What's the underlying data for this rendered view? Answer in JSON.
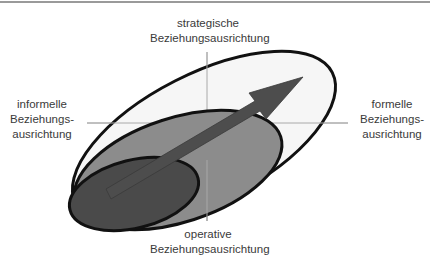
{
  "diagram": {
    "axes": {
      "top": {
        "line1": "strategische",
        "line2": "Beziehungsausrichtung"
      },
      "bottom": {
        "line1": "operative",
        "line2": "Beziehungsausrichtung"
      },
      "left": {
        "line1": "informelle",
        "line2": "Beziehungs-",
        "line3": "ausrichtung"
      },
      "right": {
        "line1": "formelle",
        "line2": "Beziehungs-",
        "line3": "ausrichtung"
      }
    },
    "shapes": {
      "outer_ellipse": {
        "fill": "#f4f4f4",
        "stroke": "#111111"
      },
      "middle_ellipse": {
        "fill": "#8c8c8c",
        "stroke": "#111111"
      },
      "inner_ellipse": {
        "fill": "#4a4a4a",
        "stroke": "#111111"
      },
      "arrow": {
        "fill": "#4d4d4d",
        "direction": "bottom-left to top-right"
      }
    },
    "colors": {
      "axis_line": "#a0a0a0",
      "text": "#3a3a3a"
    }
  }
}
